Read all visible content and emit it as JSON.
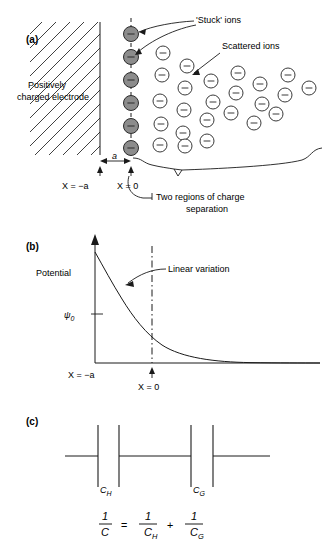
{
  "figure": {
    "panels": [
      {
        "id": "a",
        "label": "(a)"
      },
      {
        "id": "b",
        "label": "(b)"
      },
      {
        "id": "c",
        "label": "(c)"
      }
    ]
  },
  "panel_a": {
    "label": "(a)",
    "electrode_label_line1": "Positively",
    "electrode_label_line2": "charged electrode",
    "stuck_ions_label": "'Stuck' ions",
    "scattered_ions_label": "Scattered ions",
    "dimension_label": "a",
    "x_neg_a_label": "X = −a",
    "x_zero_label": "X = 0",
    "regions_label_line1": "Two regions of charge",
    "regions_label_line2": "separation",
    "ion_charge_sign": "−",
    "stuck_ions": [
      {
        "cx": 131,
        "cy": 34
      },
      {
        "cx": 131,
        "cy": 57
      },
      {
        "cx": 131,
        "cy": 80
      },
      {
        "cx": 131,
        "cy": 103
      },
      {
        "cx": 131,
        "cy": 126
      },
      {
        "cx": 131,
        "cy": 148
      }
    ],
    "scattered_ions": [
      {
        "cx": 163,
        "cy": 53
      },
      {
        "cx": 162,
        "cy": 75
      },
      {
        "cx": 187,
        "cy": 66
      },
      {
        "cx": 185,
        "cy": 88
      },
      {
        "cx": 160,
        "cy": 101
      },
      {
        "cx": 211,
        "cy": 81
      },
      {
        "cx": 213,
        "cy": 102
      },
      {
        "cx": 236,
        "cy": 93
      },
      {
        "cx": 238,
        "cy": 73
      },
      {
        "cx": 260,
        "cy": 84
      },
      {
        "cx": 262,
        "cy": 104
      },
      {
        "cx": 285,
        "cy": 95
      },
      {
        "cx": 288,
        "cy": 75
      },
      {
        "cx": 309,
        "cy": 88
      },
      {
        "cx": 184,
        "cy": 110
      },
      {
        "cx": 207,
        "cy": 120
      },
      {
        "cx": 231,
        "cy": 113
      },
      {
        "cx": 254,
        "cy": 123
      },
      {
        "cx": 161,
        "cy": 124
      },
      {
        "cx": 183,
        "cy": 133
      },
      {
        "cx": 160,
        "cy": 145
      },
      {
        "cx": 185,
        "cy": 146
      },
      {
        "cx": 207,
        "cy": 141
      },
      {
        "cx": 276,
        "cy": 114
      }
    ]
  },
  "panel_b": {
    "label": "(b)",
    "y_axis_label": "Potential",
    "psi_symbol": "ψ",
    "psi_subscript": "0",
    "linear_variation_label": "Linear variation",
    "x_neg_a_label": "X = −a",
    "x_zero_label": "X = 0"
  },
  "panel_c": {
    "label": "(c)",
    "capacitor_h_symbol": "C",
    "capacitor_h_subscript": "H",
    "capacitor_g_symbol": "C",
    "capacitor_g_subscript": "G",
    "equation": {
      "lhs_numerator": "1",
      "lhs_denominator": "C",
      "equals": "=",
      "term1_numerator": "1",
      "term1_denominator": "C",
      "term1_subscript": "H",
      "plus": "+",
      "term2_numerator": "1",
      "term2_denominator": "C",
      "term2_subscript": "G"
    }
  },
  "colors": {
    "stroke": "#1a1a1a",
    "stuck_ion_fill": "#8c8c8c",
    "open_ion_fill": "#ffffff",
    "background": "#ffffff"
  }
}
